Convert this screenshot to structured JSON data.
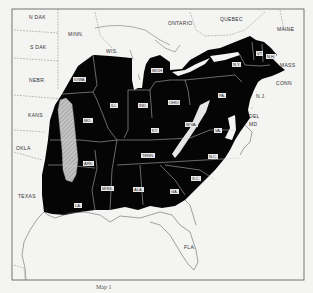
{
  "map": {
    "title": "",
    "caption": "Map 1",
    "colors": {
      "background": "#f4f4f2",
      "range_fill": "#050505",
      "hatched_fill": "#b8b8b8",
      "border_line": "#555555",
      "state_line_in_range": "#cfcfcf"
    },
    "outside_labels": [
      {
        "id": "n-dak",
        "text": "N DAK",
        "x": 29,
        "y": 17
      },
      {
        "id": "s-dak",
        "text": "S DAK",
        "x": 30,
        "y": 47
      },
      {
        "id": "minn",
        "text": "MINN.",
        "x": 70,
        "y": 34
      },
      {
        "id": "wis",
        "text": "WIS.",
        "x": 108,
        "y": 51
      },
      {
        "id": "nebr",
        "text": "NEBR.",
        "x": 30,
        "y": 80
      },
      {
        "id": "kans",
        "text": "KANS",
        "x": 28,
        "y": 115
      },
      {
        "id": "okla",
        "text": "OKLA",
        "x": 16,
        "y": 148
      },
      {
        "id": "texas",
        "text": "TEXAS",
        "x": 20,
        "y": 196
      },
      {
        "id": "ontario",
        "text": "ONTARIO",
        "x": 170,
        "y": 23
      },
      {
        "id": "quebec",
        "text": "QUEBEC",
        "x": 220,
        "y": 19
      },
      {
        "id": "maine",
        "text": "MAINE",
        "x": 278,
        "y": 29
      },
      {
        "id": "mass",
        "text": "MASS",
        "x": 280,
        "y": 64
      },
      {
        "id": "conn",
        "text": "CONN",
        "x": 277,
        "y": 82
      },
      {
        "id": "nj",
        "text": "N.J.",
        "x": 256,
        "y": 96
      },
      {
        "id": "del",
        "text": "DEL",
        "x": 250,
        "y": 115
      },
      {
        "id": "md",
        "text": "MD",
        "x": 250,
        "y": 123
      },
      {
        "id": "fla",
        "text": "FLA.",
        "x": 185,
        "y": 247
      }
    ],
    "range_labels": [
      {
        "id": "iowa",
        "text": "IOWA",
        "x": 75,
        "y": 79
      },
      {
        "id": "mich",
        "text": "MICH",
        "x": 153,
        "y": 70
      },
      {
        "id": "ill",
        "text": "ILL",
        "x": 111,
        "y": 105
      },
      {
        "id": "ind",
        "text": "IND.",
        "x": 139,
        "y": 105
      },
      {
        "id": "ohio",
        "text": "OHIO",
        "x": 170,
        "y": 102
      },
      {
        "id": "pa",
        "text": "PA.",
        "x": 219,
        "y": 95
      },
      {
        "id": "ny",
        "text": "N.Y.",
        "x": 233,
        "y": 64
      },
      {
        "id": "vt",
        "text": "VT",
        "x": 257,
        "y": 53
      },
      {
        "id": "nh",
        "text": "N.H.",
        "x": 267,
        "y": 56
      },
      {
        "id": "mo",
        "text": "MO.",
        "x": 84,
        "y": 120
      },
      {
        "id": "ky",
        "text": "KY.",
        "x": 152,
        "y": 130
      },
      {
        "id": "wva",
        "text": "W.VA.",
        "x": 187,
        "y": 124
      },
      {
        "id": "va",
        "text": "VA.",
        "x": 215,
        "y": 130
      },
      {
        "id": "ark",
        "text": "ARK.",
        "x": 84,
        "y": 163
      },
      {
        "id": "tenn",
        "text": "TENN.",
        "x": 143,
        "y": 155
      },
      {
        "id": "nc",
        "text": "N.C.",
        "x": 209,
        "y": 156
      },
      {
        "id": "sc",
        "text": "S.C.",
        "x": 192,
        "y": 178
      },
      {
        "id": "miss",
        "text": "MISS.",
        "x": 103,
        "y": 188
      },
      {
        "id": "ala",
        "text": "ALA.",
        "x": 134,
        "y": 189
      },
      {
        "id": "ga",
        "text": "GA.",
        "x": 171,
        "y": 191
      },
      {
        "id": "la",
        "text": "LA.",
        "x": 75,
        "y": 205
      }
    ],
    "legend": {
      "black_area": "Distribution range",
      "hatched_area": "Excluded / hatched area (Ozark region)"
    }
  }
}
